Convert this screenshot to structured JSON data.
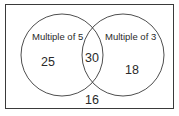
{
  "diagram": {
    "type": "venn",
    "sets": [
      {
        "label": "Multiple of 5",
        "only_count": "25"
      },
      {
        "label": "Multiple of 3",
        "only_count": "18"
      }
    ],
    "intersection_count": "30",
    "outside_count": "16"
  },
  "colors": {
    "stroke": "#3a3a3a",
    "text": "#2a2a2a",
    "background": "#ffffff"
  }
}
